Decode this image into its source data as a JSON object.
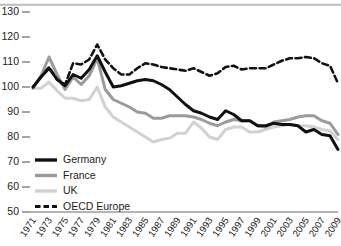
{
  "chart_data": {
    "type": "line",
    "title": "",
    "subtitle": "",
    "xlabel": "",
    "ylabel": "",
    "xlim": [
      1971,
      2009
    ],
    "ylim": [
      50,
      130
    ],
    "yticks": [
      50,
      60,
      70,
      80,
      90,
      100,
      110,
      120,
      130
    ],
    "grid": false,
    "legend_position": "bottom-left",
    "x": [
      1971,
      1972,
      1973,
      1974,
      1975,
      1976,
      1977,
      1978,
      1979,
      1980,
      1981,
      1982,
      1983,
      1984,
      1985,
      1986,
      1987,
      1988,
      1989,
      1990,
      1991,
      1992,
      1993,
      1994,
      1995,
      1996,
      1997,
      1998,
      1999,
      2000,
      2001,
      2002,
      2003,
      2004,
      2005,
      2006,
      2007,
      2008,
      2009
    ],
    "xticks": [
      1971,
      1973,
      1975,
      1977,
      1979,
      1981,
      1983,
      1985,
      1987,
      1989,
      1991,
      1993,
      1995,
      1997,
      1999,
      2001,
      2003,
      2005,
      2007,
      2009
    ],
    "series": [
      {
        "name": "Germany",
        "color": "#111111",
        "width": 3.0,
        "dash": "none",
        "values": [
          100.0,
          104.0,
          107.5,
          103.0,
          100.5,
          105.0,
          103.5,
          107.0,
          112.5,
          106.0,
          100.0,
          100.5,
          101.5,
          102.5,
          103.0,
          102.5,
          101.0,
          99.0,
          96.0,
          93.0,
          90.5,
          89.5,
          88.0,
          87.0,
          90.5,
          89.0,
          86.5,
          86.5,
          84.5,
          84.5,
          85.5,
          85.0,
          85.0,
          84.5,
          82.0,
          83.0,
          81.0,
          80.5,
          75.0
        ]
      },
      {
        "name": "France",
        "color": "#9b9b9b",
        "width": 3.0,
        "dash": "none",
        "values": [
          99.5,
          104.5,
          112.0,
          105.0,
          99.0,
          104.0,
          101.0,
          104.5,
          111.5,
          99.0,
          95.0,
          93.5,
          92.0,
          90.0,
          89.5,
          87.5,
          87.5,
          88.5,
          88.5,
          88.5,
          88.0,
          87.0,
          85.5,
          84.5,
          86.0,
          87.0,
          86.5,
          86.5,
          84.5,
          84.0,
          86.0,
          86.5,
          87.0,
          88.0,
          88.5,
          88.5,
          86.5,
          85.5,
          81.0
        ]
      },
      {
        "name": "UK",
        "color": "#d2d2d2",
        "width": 3.0,
        "dash": "none",
        "values": [
          99.5,
          99.5,
          102.0,
          98.5,
          95.5,
          95.5,
          94.5,
          95.0,
          100.0,
          92.0,
          88.0,
          86.0,
          84.0,
          82.0,
          80.0,
          78.0,
          79.0,
          79.5,
          81.5,
          81.5,
          86.0,
          83.5,
          80.0,
          79.0,
          83.0,
          84.0,
          84.0,
          82.0,
          82.0,
          83.0,
          84.0,
          84.5,
          85.0,
          84.5,
          84.5,
          84.0,
          83.0,
          82.5,
          79.0
        ]
      },
      {
        "name": "OECD Europe",
        "color": "#111111",
        "width": 2.6,
        "dash": "6,3.5",
        "values": [
          100.0,
          104.0,
          108.0,
          103.0,
          101.0,
          109.5,
          109.0,
          111.0,
          117.0,
          111.0,
          107.5,
          105.0,
          105.0,
          107.5,
          109.5,
          109.0,
          108.0,
          107.5,
          107.0,
          106.5,
          107.5,
          106.0,
          104.5,
          105.5,
          108.0,
          108.5,
          107.0,
          107.5,
          107.5,
          107.5,
          109.0,
          110.5,
          111.5,
          111.5,
          112.0,
          111.5,
          109.5,
          108.5,
          101.5
        ]
      }
    ]
  },
  "legend": {
    "items": [
      {
        "label": "Germany",
        "color": "#111111",
        "dash": "none",
        "width": 3.4
      },
      {
        "label": "France",
        "color": "#9b9b9b",
        "dash": "none",
        "width": 3.4
      },
      {
        "label": "UK",
        "color": "#d2d2d2",
        "dash": "none",
        "width": 3.4
      },
      {
        "label": "OECD Europe",
        "color": "#111111",
        "dash": "5.5,3",
        "width": 3.2
      }
    ]
  }
}
